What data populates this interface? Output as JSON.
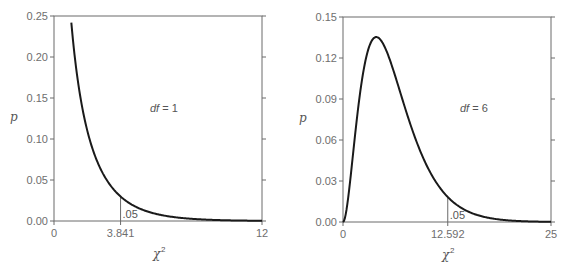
{
  "chart_data": [
    {
      "type": "line",
      "title": "",
      "annotation": {
        "df_label": "df",
        "df_eq": " = 1",
        "df": 1
      },
      "xlabel": "χ",
      "xlabel_sup": "2",
      "ylabel": "p",
      "xlim": [
        0,
        12
      ],
      "ylim": [
        0,
        0.25
      ],
      "yticks": [
        "0.00",
        "0.05",
        "0.10",
        "0.15",
        "0.20",
        "0.25"
      ],
      "ytick_values": [
        0,
        0.05,
        0.1,
        0.15,
        0.2,
        0.25
      ],
      "xtick_labels": [
        "0",
        "3.841",
        "12"
      ],
      "xtick_values": [
        0,
        3.841,
        12
      ],
      "critical_value": 3.841,
      "critical_label": ".05",
      "grid": false,
      "x": [
        1,
        1.5,
        2,
        2.5,
        3,
        3.841,
        4,
        5,
        6,
        7,
        8,
        9,
        10,
        11,
        12
      ],
      "values": [
        0.242,
        0.1539,
        0.1038,
        0.0725,
        0.0514,
        0.0298,
        0.027,
        0.0146,
        0.008,
        0.0044,
        0.0024,
        0.0015,
        0.0009,
        0.0005,
        0.0003
      ],
      "frame": {
        "left": 54,
        "right": 262,
        "top": 16,
        "bottom": 221
      }
    },
    {
      "type": "line",
      "title": "",
      "annotation": {
        "df_label": "df",
        "df_eq": " = 6",
        "df": 6
      },
      "xlabel": "χ",
      "xlabel_sup": "2",
      "ylabel": "p",
      "xlim": [
        0,
        25
      ],
      "ylim": [
        0,
        0.15
      ],
      "yticks": [
        "0.00",
        "0.03",
        "0.06",
        "0.09",
        "0.12",
        "0.15"
      ],
      "ytick_values": [
        0,
        0.03,
        0.06,
        0.09,
        0.12,
        0.15
      ],
      "xtick_labels": [
        "0",
        "12.592",
        "25"
      ],
      "xtick_values": [
        0,
        12.592,
        25
      ],
      "critical_value": 12.592,
      "critical_label": ".05",
      "grid": false,
      "x": [
        0,
        1,
        2,
        3,
        4,
        5,
        6,
        7,
        8,
        9,
        10,
        11,
        12,
        12.592,
        14,
        16,
        18,
        20,
        22,
        25
      ],
      "values": [
        0,
        0.0379,
        0.092,
        0.1255,
        0.1353,
        0.1282,
        0.112,
        0.0925,
        0.0733,
        0.0562,
        0.0421,
        0.0309,
        0.0223,
        0.0183,
        0.0112,
        0.0054,
        0.0025,
        0.0011,
        0.0005,
        0.0001
      ],
      "frame": {
        "left": 343,
        "right": 551,
        "top": 17,
        "bottom": 222
      }
    }
  ]
}
